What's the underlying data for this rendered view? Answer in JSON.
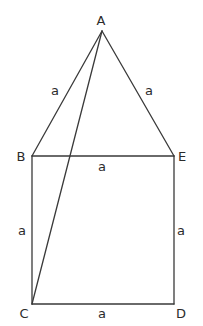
{
  "diagram": {
    "stroke_color": "#3a3a3a",
    "points": {
      "A": {
        "label": "A",
        "x": 102,
        "y": 31,
        "lx": 101,
        "ly": 25
      },
      "B": {
        "label": "B",
        "x": 32,
        "y": 156,
        "lx": 21,
        "ly": 161
      },
      "E": {
        "label": "E",
        "x": 174,
        "y": 156,
        "lx": 182,
        "ly": 161
      },
      "C": {
        "label": "C",
        "x": 32,
        "y": 304,
        "lx": 24,
        "ly": 318
      },
      "D": {
        "label": "D",
        "x": 174,
        "y": 304,
        "lx": 181,
        "ly": 318
      }
    },
    "segments": [
      {
        "from": "A",
        "to": "B",
        "label": "a"
      },
      {
        "from": "A",
        "to": "E",
        "label": "a"
      },
      {
        "from": "B",
        "to": "E",
        "label": "a"
      },
      {
        "from": "B",
        "to": "C",
        "label": "a"
      },
      {
        "from": "E",
        "to": "D",
        "label": "a"
      },
      {
        "from": "C",
        "to": "D",
        "label": "a"
      },
      {
        "from": "A",
        "to": "C",
        "label": ""
      }
    ],
    "side_labels": {
      "AB": "a",
      "AE": "a",
      "BE": "a",
      "BC": "a",
      "ED": "a",
      "CD": "a"
    }
  }
}
